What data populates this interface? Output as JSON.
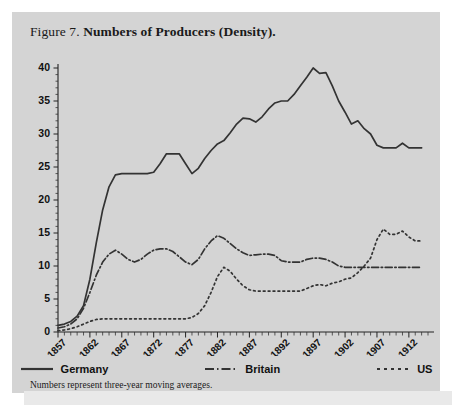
{
  "figure": {
    "number_label": "Figure 7.",
    "title": "Numbers of Producers (Density).",
    "note": "Numbers represent three-year moving averages."
  },
  "legend": {
    "items": [
      {
        "label": "Germany",
        "style": "solid",
        "color": "#333333"
      },
      {
        "label": "Britain",
        "style": "dashdot",
        "color": "#333333"
      },
      {
        "label": "US",
        "style": "dotted",
        "color": "#333333"
      }
    ]
  },
  "chart_data": {
    "type": "line",
    "title": "Numbers of Producers (Density).",
    "xlabel": "",
    "ylabel": "",
    "xlim": [
      1857,
      1915
    ],
    "ylim": [
      0,
      40
    ],
    "yticks": [
      0,
      5,
      10,
      15,
      20,
      25,
      30,
      35,
      40
    ],
    "xticks": [
      1857,
      1862,
      1867,
      1872,
      1877,
      1882,
      1887,
      1892,
      1897,
      1902,
      1907,
      1912
    ],
    "x_minor_tick_interval": 1,
    "grid": false,
    "legend_position": "below",
    "annotation": "Numbers represent three-year moving averages.",
    "x": [
      1857,
      1858,
      1859,
      1860,
      1861,
      1862,
      1863,
      1864,
      1865,
      1866,
      1867,
      1868,
      1869,
      1870,
      1871,
      1872,
      1873,
      1874,
      1875,
      1876,
      1877,
      1878,
      1879,
      1880,
      1881,
      1882,
      1883,
      1884,
      1885,
      1886,
      1887,
      1888,
      1889,
      1890,
      1891,
      1892,
      1893,
      1894,
      1895,
      1896,
      1897,
      1898,
      1899,
      1900,
      1901,
      1902,
      1903,
      1904,
      1905,
      1906,
      1907,
      1908,
      1909,
      1910,
      1911,
      1912,
      1913,
      1914
    ],
    "series": [
      {
        "name": "Germany",
        "style": "solid",
        "color": "#333333",
        "values": [
          1.0,
          1.2,
          1.6,
          2.4,
          4.0,
          8.0,
          13.5,
          18.5,
          22.0,
          23.8,
          24.0,
          24.0,
          24.0,
          24.0,
          24.0,
          24.2,
          25.5,
          27.0,
          27.0,
          27.0,
          25.5,
          24.0,
          24.8,
          26.3,
          27.5,
          28.5,
          29.0,
          30.2,
          31.5,
          32.4,
          32.3,
          31.8,
          32.6,
          33.8,
          34.7,
          35.0,
          35.0,
          36.0,
          37.3,
          38.6,
          40.0,
          39.2,
          39.3,
          37.3,
          35.0,
          33.3,
          31.5,
          32.0,
          30.8,
          30.0,
          28.3,
          27.9,
          27.9,
          27.9,
          28.6,
          27.9,
          27.9,
          27.9
        ]
      },
      {
        "name": "Britain",
        "style": "dashdot",
        "color": "#333333",
        "values": [
          0.6,
          0.8,
          1.2,
          2.0,
          3.6,
          6.0,
          8.6,
          10.6,
          11.8,
          12.4,
          11.8,
          11.0,
          10.6,
          11.0,
          11.8,
          12.4,
          12.6,
          12.6,
          12.2,
          11.4,
          10.6,
          10.2,
          11.0,
          12.6,
          13.8,
          14.6,
          14.2,
          13.4,
          12.6,
          12.0,
          11.6,
          11.7,
          11.8,
          11.8,
          11.6,
          10.8,
          10.6,
          10.6,
          10.6,
          11.0,
          11.2,
          11.2,
          11.0,
          10.6,
          10.0,
          9.8,
          9.8,
          9.8,
          9.8,
          9.8,
          9.8,
          9.8,
          9.8,
          9.8,
          9.8,
          9.8,
          9.8,
          9.8
        ]
      },
      {
        "name": "US",
        "style": "dotted",
        "color": "#333333",
        "values": [
          0.2,
          0.3,
          0.5,
          0.8,
          1.2,
          1.6,
          1.9,
          2.0,
          2.0,
          2.0,
          2.0,
          2.0,
          2.0,
          2.0,
          2.0,
          2.0,
          2.0,
          2.0,
          2.0,
          2.0,
          2.0,
          2.2,
          2.8,
          4.0,
          6.0,
          8.4,
          9.8,
          9.2,
          8.0,
          7.0,
          6.4,
          6.2,
          6.2,
          6.2,
          6.2,
          6.2,
          6.2,
          6.2,
          6.2,
          6.6,
          7.0,
          7.2,
          7.0,
          7.4,
          7.6,
          8.0,
          8.2,
          9.0,
          10.0,
          11.2,
          14.0,
          15.6,
          14.8,
          14.8,
          15.3,
          14.4,
          13.8,
          13.8
        ]
      }
    ]
  }
}
